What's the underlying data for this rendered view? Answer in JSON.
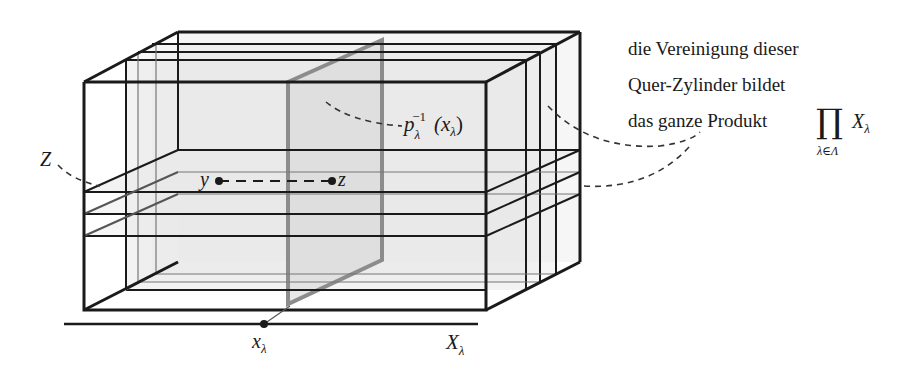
{
  "figure": {
    "labels": {
      "Z": "Z",
      "y": "y",
      "z": "z",
      "preimage_base": "p",
      "preimage_sub": "λ",
      "preimage_sup": "−1",
      "preimage_arg": "(x",
      "preimage_arg_sub": "λ",
      "preimage_close": ")",
      "x_point": "x",
      "x_point_sub": "λ",
      "axis": "X",
      "axis_sub": "λ"
    },
    "annotation": {
      "line1": "die Vereinigung dieser",
      "line2": "Quer-Zylinder bildet",
      "line3": "das ganze Produkt",
      "product_symbol": "∏",
      "product_index": "λ∈Λ",
      "product_term": "X",
      "product_term_sub": "λ"
    },
    "colors": {
      "stroke": "#1a1a1a",
      "fiber_plane": "#8c8c8c",
      "fill": "#e6e6e6"
    }
  }
}
